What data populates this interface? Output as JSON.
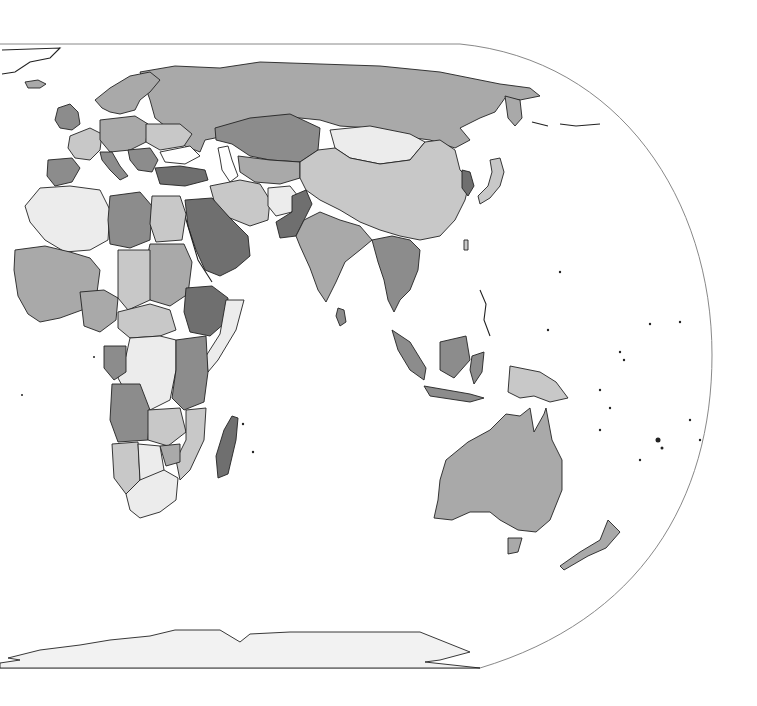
{
  "map": {
    "type": "choropleth",
    "projection": "pseudo-cylindrical (Eastern Hemisphere, Europe/Africa/Asia/Oceania)",
    "colors": {
      "ocean": "#ffffff",
      "frame": "#888888",
      "outline": "#222222",
      "shade_very_light": "#ececec",
      "shade_light": "#c8c8c8",
      "shade_medium": "#a9a9a9",
      "shade_dark": "#8c8c8c",
      "shade_very_dark": "#6f6f6f",
      "antarctica": "#f2f2f2"
    },
    "regions": [
      {
        "name": "Greenland",
        "shade": "none"
      },
      {
        "name": "Iceland",
        "shade": "medium"
      },
      {
        "name": "United Kingdom",
        "shade": "dark"
      },
      {
        "name": "Scandinavia",
        "shade": "medium"
      },
      {
        "name": "France",
        "shade": "light"
      },
      {
        "name": "Iberia",
        "shade": "dark"
      },
      {
        "name": "Central Europe",
        "shade": "medium"
      },
      {
        "name": "Eastern Europe",
        "shade": "light"
      },
      {
        "name": "Russia",
        "shade": "medium"
      },
      {
        "name": "Kazakhstan",
        "shade": "dark"
      },
      {
        "name": "Mongolia",
        "shade": "very_light"
      },
      {
        "name": "China",
        "shade": "light"
      },
      {
        "name": "Turkey",
        "shade": "very_dark"
      },
      {
        "name": "Iran",
        "shade": "light"
      },
      {
        "name": "Afghanistan",
        "shade": "very_light"
      },
      {
        "name": "Pakistan",
        "shade": "very_dark"
      },
      {
        "name": "India",
        "shade": "medium"
      },
      {
        "name": "Saudi Arabia",
        "shade": "very_dark"
      },
      {
        "name": "Southeast Asia",
        "shade": "dark"
      },
      {
        "name": "Korea",
        "shade": "very_dark"
      },
      {
        "name": "Japan",
        "shade": "light"
      },
      {
        "name": "Indonesia",
        "shade": "dark"
      },
      {
        "name": "Papua New Guinea",
        "shade": "light"
      },
      {
        "name": "Australia",
        "shade": "medium"
      },
      {
        "name": "New Zealand",
        "shade": "medium"
      },
      {
        "name": "North Africa west",
        "shade": "very_light"
      },
      {
        "name": "Libya",
        "shade": "dark"
      },
      {
        "name": "Egypt",
        "shade": "light"
      },
      {
        "name": "Sudan",
        "shade": "medium"
      },
      {
        "name": "Ethiopia",
        "shade": "very_dark"
      },
      {
        "name": "Somalia",
        "shade": "very_light"
      },
      {
        "name": "Nigeria",
        "shade": "medium"
      },
      {
        "name": "DR Congo",
        "shade": "very_light"
      },
      {
        "name": "Angola",
        "shade": "dark"
      },
      {
        "name": "Tanzania",
        "shade": "dark"
      },
      {
        "name": "Zambia",
        "shade": "light"
      },
      {
        "name": "Namibia",
        "shade": "light"
      },
      {
        "name": "Botswana",
        "shade": "very_light"
      },
      {
        "name": "South Africa",
        "shade": "very_light"
      },
      {
        "name": "Madagascar",
        "shade": "very_dark"
      },
      {
        "name": "Sri Lanka",
        "shade": "dark"
      },
      {
        "name": "Antarctica",
        "shade": "antarctica"
      }
    ]
  }
}
